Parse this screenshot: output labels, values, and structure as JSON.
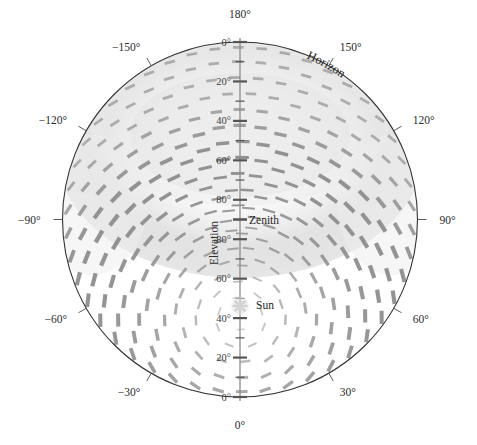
{
  "figure": {
    "kind": "polar-sky-polarization-plot",
    "background_color": "#ffffff",
    "outline_color": "#333333",
    "dash_color": "#8a8a8a",
    "axis_line_color": "#8c8c8c",
    "center_px": {
      "x": 240,
      "y": 219.5
    },
    "radius_px": 177.5
  },
  "labels": {
    "horizon": "Horizon",
    "zenith": "Zenith",
    "sun": "Sun",
    "elevation_axis_title": "Elevation"
  },
  "azimuth_axis": {
    "unit": "degrees",
    "ticks": [
      {
        "label": "0°",
        "value": 0
      },
      {
        "label": "30°",
        "value": 30
      },
      {
        "label": "60°",
        "value": 60
      },
      {
        "label": "90°",
        "value": 90
      },
      {
        "label": "120°",
        "value": 120
      },
      {
        "label": "150°",
        "value": 150
      },
      {
        "label": "180°",
        "value": 180
      },
      {
        "label": "−150°",
        "value": -150
      },
      {
        "label": "−120°",
        "value": -120
      },
      {
        "label": "−90°",
        "value": -90
      },
      {
        "label": "−60°",
        "value": -60
      },
      {
        "label": "−30°",
        "value": -30
      }
    ]
  },
  "elevation_axis": {
    "unit": "degrees",
    "upper_ticks": [
      "0°",
      "20°",
      "40°",
      "60°",
      "80°"
    ],
    "lower_ticks": [
      "80°",
      "60°",
      "40°",
      "20°",
      "0°"
    ],
    "zenith_label": "Zenith"
  },
  "chart_data": {
    "type": "scatter",
    "title": "",
    "subtitle": "",
    "xlabel": "Azimuth",
    "ylabel": "Elevation",
    "projection": "polar-hemispherical",
    "grid": false,
    "legend_position": "none",
    "annotations": [
      "Horizon",
      "Zenith",
      "Sun",
      "Elevation"
    ],
    "azimuth_ticks": [
      -150,
      -120,
      -90,
      -60,
      -30,
      0,
      30,
      60,
      90,
      120,
      150,
      180
    ],
    "azimuth_tick_labels": [
      "−150°",
      "−120°",
      "−90°",
      "−60°",
      "−30°",
      "0°",
      "30°",
      "60°",
      "90°",
      "120°",
      "150°",
      "180°"
    ],
    "elevation_ticks": [
      0,
      20,
      40,
      60,
      80,
      90
    ],
    "elevation_tick_labels": [
      "0°",
      "20°",
      "40°",
      "60°",
      "80°",
      "Zenith"
    ],
    "radial_range_deg": [
      0,
      90
    ],
    "sun": {
      "azimuth_deg": 0,
      "elevation_deg": 40
    },
    "antisun": {
      "azimuth_deg": 180,
      "elevation_deg": 40
    },
    "max_polarization": 1.0,
    "rings": [
      {
        "radius_frac": 0.08,
        "n": 8,
        "thickness": 0.35
      },
      {
        "radius_frac": 0.17,
        "n": 12,
        "thickness": 0.45
      },
      {
        "radius_frac": 0.26,
        "n": 16,
        "thickness": 0.55
      },
      {
        "radius_frac": 0.35,
        "n": 20,
        "thickness": 0.65
      },
      {
        "radius_frac": 0.44,
        "n": 24,
        "thickness": 0.75
      },
      {
        "radius_frac": 0.53,
        "n": 28,
        "thickness": 0.85
      },
      {
        "radius_frac": 0.62,
        "n": 30,
        "thickness": 0.92
      },
      {
        "radius_frac": 0.71,
        "n": 34,
        "thickness": 0.96
      },
      {
        "radius_frac": 0.8,
        "n": 38,
        "thickness": 1.0
      },
      {
        "radius_frac": 0.89,
        "n": 42,
        "thickness": 0.98
      },
      {
        "radius_frac": 0.97,
        "n": 46,
        "thickness": 0.94
      }
    ]
  }
}
